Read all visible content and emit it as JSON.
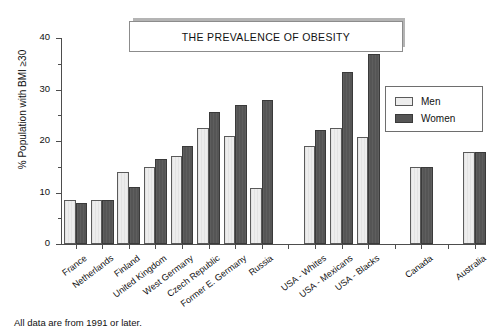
{
  "title": {
    "text": "THE PREVALENCE OF OBESITY"
  },
  "footnote": {
    "text": "All data are from 1991 or later."
  },
  "legend": {
    "position": "top-right",
    "entries": [
      {
        "label": "Men",
        "color": "#ededed"
      },
      {
        "label": "Women",
        "color": "#555555"
      }
    ]
  },
  "axis": {
    "y_title": "% Population with BMI ≥30",
    "y_ticks": [
      "0",
      "10",
      "20",
      "30",
      "40"
    ],
    "y_minor_ticks": [
      "5",
      "15",
      "25",
      "35"
    ]
  },
  "chart_data": {
    "type": "bar",
    "title": "THE PREVALENCE OF OBESITY",
    "xlabel": "",
    "ylabel": "% Population with BMI ≥30",
    "ylim": [
      0,
      40
    ],
    "ytick_step": 10,
    "yminor_step": 5,
    "grid": false,
    "legend_position": "top-right",
    "annotations": [
      "All data are from 1991 or later."
    ],
    "categories": [
      "France",
      "Netherlands",
      "Finland",
      "United Kingdom",
      "West Germany",
      "Czech Republic",
      "Former E. Germany",
      "Russia",
      "USA - Whites",
      "USA - Mexicans",
      "USA - Blacks",
      "Canada",
      "Australia"
    ],
    "series": [
      {
        "name": "Men",
        "color": "#ededed",
        "values": [
          8.6,
          8.6,
          14.0,
          15.0,
          17.0,
          22.6,
          21.0,
          10.8,
          19.1,
          22.6,
          20.7,
          15.0,
          17.8
        ]
      },
      {
        "name": "Women",
        "color": "#555555",
        "values": [
          8.0,
          8.5,
          11.0,
          16.5,
          19.0,
          25.6,
          27.0,
          27.9,
          22.2,
          33.4,
          36.8,
          15.0,
          17.8
        ]
      }
    ],
    "group_gaps_after": [
      "Russia",
      "USA - Blacks",
      "Canada"
    ]
  }
}
